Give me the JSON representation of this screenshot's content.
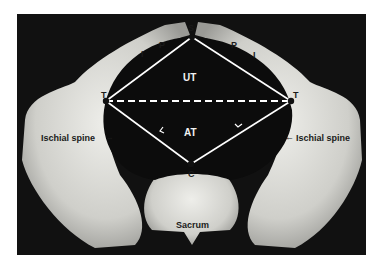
{
  "figure": {
    "points": {
      "S": {
        "label": "S"
      },
      "T_left": {
        "label": "T"
      },
      "T_right": {
        "label": "T"
      },
      "C": {
        "label": "C"
      }
    },
    "region_labels": {
      "upper_triangle": "UT",
      "anterior_triangle": "AT"
    },
    "side_labels": {
      "I_left": "I",
      "P_left": "P",
      "P_right": "P",
      "I_right": "I"
    },
    "annotations": {
      "ischial_spine_left": "Ischial spine",
      "ischial_spine_right": "Ischial spine",
      "sacrum": "Sacrum",
      "arrow_left": "→",
      "arrow_right": "←"
    },
    "colors": {
      "background": "#111111",
      "bone": "#d9d9d4",
      "lines": "#ffffff"
    }
  }
}
